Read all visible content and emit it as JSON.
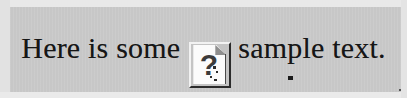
{
  "document": {
    "title": "Broken image placeholder in text line",
    "background_color": "#c9c9c9",
    "text_color": "#161616",
    "border_color": "#e9e9e9"
  },
  "line": {
    "text_before": "Here is some",
    "text_after": "sample text.",
    "full_text": "Here is some  sample text."
  },
  "placeholder_icon": {
    "name": "broken-image-icon",
    "glyph": "?",
    "alt_state": "missing image",
    "sheet_color": "#fbfbfb",
    "glyph_color": "#3b3b3b",
    "frame_color": "#2b2b2b"
  }
}
